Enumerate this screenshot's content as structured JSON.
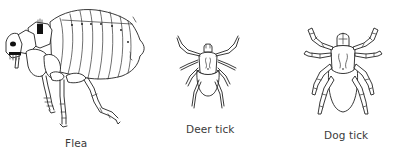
{
  "illustrations": [
    {
      "id": "flea",
      "label": "Flea",
      "icon": "flea-illustration"
    },
    {
      "id": "deer-tick",
      "label": "Deer tick",
      "icon": "deer-tick-illustration"
    },
    {
      "id": "dog-tick",
      "label": "Dog tick",
      "icon": "dog-tick-illustration"
    }
  ],
  "colors": {
    "background": "#ffffff",
    "line": "#222222",
    "label_text": "#3a3a3a"
  }
}
